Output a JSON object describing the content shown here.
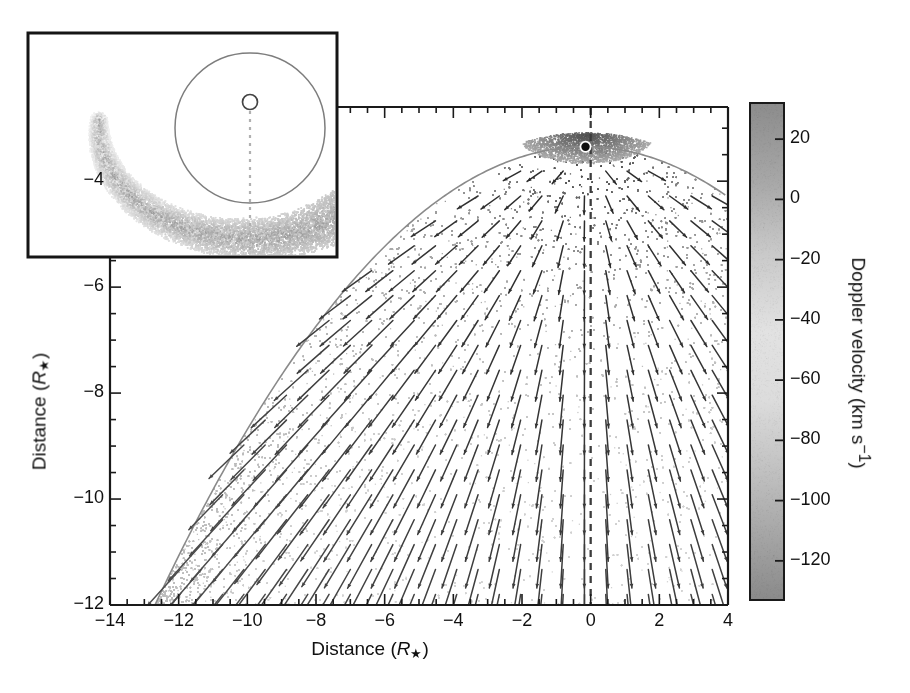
{
  "figure": {
    "type": "scientific-figure",
    "background": "#ffffff"
  },
  "chart_data": {
    "type": "scatter",
    "title": "",
    "xlabel": "Distance (R*)",
    "ylabel": "Distance (R*)",
    "xlim": [
      -14,
      4
    ],
    "ylim": [
      -12,
      -2.6
    ],
    "xticks": [
      -14,
      -12,
      -10,
      -8,
      -6,
      -4,
      -2,
      0,
      2,
      4
    ],
    "xtick_labels": [
      "-14",
      "-12",
      "-10",
      "-8",
      "-6",
      "-4",
      "-2",
      "0",
      "2",
      "4"
    ],
    "yticks": [
      -12,
      -10,
      -8,
      -6,
      -4
    ],
    "ytick_labels": [
      "-12",
      "-10",
      "-8",
      "-6",
      "-4"
    ],
    "minor_tick_step": 0.5,
    "grid": false,
    "legend": false,
    "star_marker": {
      "x": -0.15,
      "y": -3.35,
      "label": "star-position"
    },
    "vertical_dashed_line_x": 0,
    "overlays": [
      "greyscale-doppler-velocity-point-cloud",
      "velocity-vector-field-arrows",
      "shock-front-grey-curve",
      "vertical-dashed-symmetry-axis"
    ],
    "vector_field": {
      "description": "outflow velocity arrows diverging from the star position",
      "x_start": -13.2,
      "x_step": 0.62,
      "y_start": -11.8,
      "y_step": 0.47
    },
    "cloud": {
      "description": "grey point cloud of circumstellar material, densest near the star and along the upper boundary"
    }
  },
  "colorbar": {
    "label": "Doppler velocity (km s",
    "label_exp": "-1",
    "label_tail": ")",
    "ticks": [
      20,
      0,
      -20,
      -40,
      -60,
      -80,
      -100,
      -120
    ],
    "tick_labels": [
      "20",
      "0",
      "-20",
      "-40",
      "-60",
      "-80",
      "-100",
      "-120"
    ],
    "vmin": -133,
    "vmax": 32,
    "orientation": "vertical",
    "colors": {
      "top": "#8c8c8c",
      "upper_mid": "#c9c9c9",
      "mid": "#e2e2e2",
      "lower_mid": "#bdbdbd",
      "bottom": "#8a8a8a"
    }
  },
  "inset": {
    "name": "schematic-inset",
    "border_color": "#151515",
    "elements": [
      {
        "name": "outer-circle",
        "type": "circle",
        "stroke": "#7d7d7d"
      },
      {
        "name": "star-circle",
        "type": "circle",
        "stroke": "#444444"
      },
      {
        "name": "symmetry-axis",
        "type": "dotted-line",
        "stroke": "#b0b0b0"
      },
      {
        "name": "tail-arc",
        "type": "grey-arc-cloud",
        "fill": "#b6b6b6"
      }
    ]
  },
  "axes_style": {
    "spine_color": "#1a1a1a",
    "tick_color": "#1a1a1a",
    "arrow_color": "#3a3a3a",
    "curve_color": "#8a8a8a",
    "dash_color": "#3c3c3c"
  }
}
